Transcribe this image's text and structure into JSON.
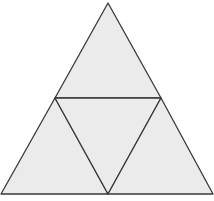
{
  "diagram": {
    "type": "subdivided-equilateral-triangle",
    "background": "#ffffff",
    "fill": "#ebebeb",
    "stroke": "#3a3a3a",
    "stroke_width": 1.3,
    "vertices": {
      "top": [
        108,
        3
      ],
      "bottom_left": [
        1,
        194
      ],
      "bottom_right": [
        213,
        194
      ],
      "mid_left": [
        55,
        98
      ],
      "mid_right": [
        161,
        98
      ],
      "mid_bottom": [
        108,
        194
      ]
    },
    "sub_triangles": [
      {
        "name": "top",
        "points": [
          [
            108,
            3
          ],
          [
            55,
            98
          ],
          [
            161,
            98
          ]
        ]
      },
      {
        "name": "bottom-left",
        "points": [
          [
            55,
            98
          ],
          [
            1,
            194
          ],
          [
            108,
            194
          ]
        ]
      },
      {
        "name": "center",
        "points": [
          [
            55,
            98
          ],
          [
            161,
            98
          ],
          [
            108,
            194
          ]
        ]
      },
      {
        "name": "bottom-right",
        "points": [
          [
            161,
            98
          ],
          [
            108,
            194
          ],
          [
            213,
            194
          ]
        ]
      }
    ]
  }
}
